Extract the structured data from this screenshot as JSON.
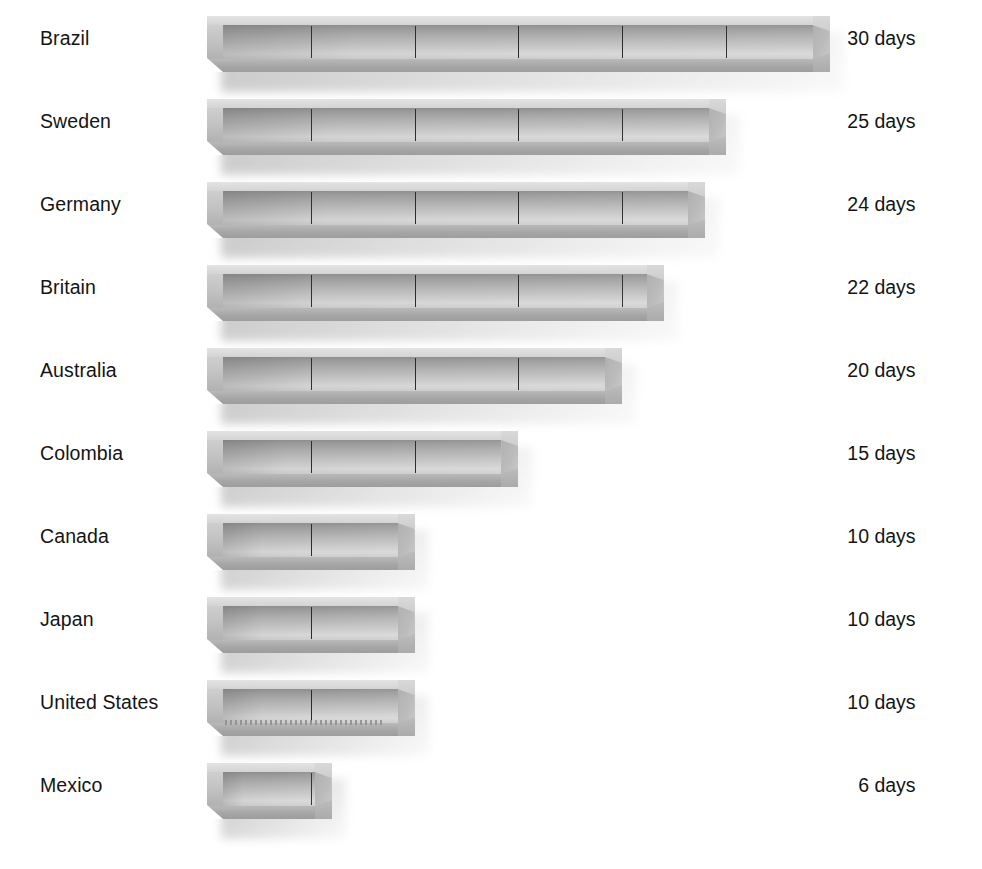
{
  "chart_data": {
    "type": "bar",
    "title": "",
    "subtitle": "",
    "xlabel": "",
    "ylabel": "",
    "orientation": "horizontal",
    "unit": "days",
    "grid": false,
    "legend": null,
    "axis_visible": false,
    "xlim": [
      0,
      30
    ],
    "segment_interval": 5,
    "categories": [
      "Brazil",
      "Sweden",
      "Germany",
      "Britain",
      "Australia",
      "Colombia",
      "Canada",
      "Japan",
      "United States",
      "Mexico"
    ],
    "values": [
      30,
      25,
      24,
      22,
      20,
      15,
      10,
      10,
      10,
      6
    ],
    "value_labels": [
      "30 days",
      "25 days",
      "24 days",
      "22 days",
      "20 days",
      "15 days",
      "10 days",
      "10 days",
      "10 days",
      "6 days"
    ]
  },
  "rows": [
    {
      "country": "Brazil",
      "value": 30,
      "value_number": "30",
      "value_unit": "days",
      "value_label": "30 days",
      "dividers": 5,
      "serrated": false
    },
    {
      "country": "Sweden",
      "value": 25,
      "value_number": "25",
      "value_unit": "days",
      "value_label": "25 days",
      "dividers": 4,
      "serrated": false
    },
    {
      "country": "Germany",
      "value": 24,
      "value_number": "24",
      "value_unit": "days",
      "value_label": "24 days",
      "dividers": 4,
      "serrated": false
    },
    {
      "country": "Britain",
      "value": 22,
      "value_number": "22",
      "value_unit": "days",
      "value_label": "22 days",
      "dividers": 4,
      "serrated": false
    },
    {
      "country": "Australia",
      "value": 20,
      "value_number": "20",
      "value_unit": "days",
      "value_label": "20 days",
      "dividers": 4,
      "serrated": false
    },
    {
      "country": "Colombia",
      "value": 15,
      "value_number": "15",
      "value_unit": "days",
      "value_label": "15 days",
      "dividers": 2,
      "serrated": false
    },
    {
      "country": "Canada",
      "value": 10,
      "value_number": "10",
      "value_unit": "days",
      "value_label": "10 days",
      "dividers": 1,
      "serrated": false
    },
    {
      "country": "Japan",
      "value": 10,
      "value_number": "10",
      "value_unit": "days",
      "value_label": "10 days",
      "dividers": 1,
      "serrated": false
    },
    {
      "country": "United States",
      "value": 10,
      "value_number": "10",
      "value_unit": "days",
      "value_label": "10 days",
      "dividers": 1,
      "serrated": true
    },
    {
      "country": "Mexico",
      "value": 6,
      "value_number": "6",
      "value_unit": "days",
      "value_label": "6 days",
      "dividers": 1,
      "serrated": false
    }
  ],
  "colors": {
    "background": "#ffffff",
    "text": "#141414",
    "bar_light": "#e3e3e3",
    "bar_mid": "#c2c2c2",
    "bar_dark": "#8f8f8f",
    "divider": "#2a2a2a",
    "shadow": "#969696"
  },
  "layout": {
    "bar_origin_x": 207,
    "px_per_day": 20.75,
    "row_pitch": 83,
    "first_row_top": 20
  }
}
